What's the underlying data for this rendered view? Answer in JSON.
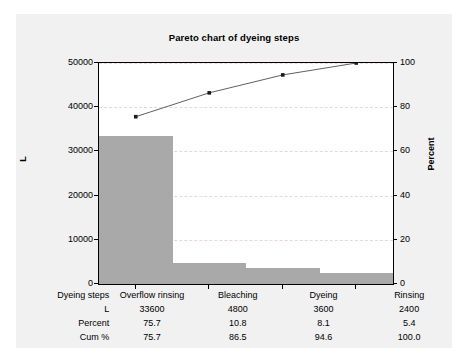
{
  "chart_data": {
    "type": "bar",
    "title": "Pareto chart of dyeing steps",
    "categories": [
      "Overflow rinsing",
      "Bleaching",
      "Dyeing",
      "Rinsing"
    ],
    "values": [
      33600,
      4800,
      3600,
      2400
    ],
    "percent": [
      75.7,
      10.8,
      8.1,
      5.4
    ],
    "cum_percent": [
      75.7,
      86.5,
      94.6,
      100.0
    ],
    "xlabel": "Dyeing steps",
    "ylabel": "L",
    "ylabel_right": "Percent",
    "ylim": [
      0,
      50000
    ],
    "ylim_right": [
      0,
      100
    ],
    "yticks": [
      "0",
      "10000",
      "20000",
      "30000",
      "40000",
      "50000"
    ],
    "ytick_values": [
      0,
      10000,
      20000,
      30000,
      40000,
      50000
    ],
    "yticks_right": [
      "0",
      "20",
      "40",
      "60",
      "80",
      "100"
    ],
    "ytick_values_right": [
      0,
      20,
      40,
      60,
      80,
      100
    ],
    "grid": true,
    "legend": "none",
    "series": [
      {
        "name": "L",
        "type": "bar",
        "values": [
          33600,
          4800,
          3600,
          2400
        ],
        "color": "#a9a9a9"
      },
      {
        "name": "Cum %",
        "type": "line",
        "values": [
          75.7,
          86.5,
          94.6,
          100.0
        ],
        "color": "#4d4d4d",
        "marker": "square"
      }
    ]
  },
  "table": {
    "rows": [
      {
        "label": "Dyeing steps",
        "cells": [
          "Overflow rinsing",
          "Bleaching",
          "Dyeing",
          "Rinsing"
        ]
      },
      {
        "label": "L",
        "cells": [
          "33600",
          "4800",
          "3600",
          "2400"
        ]
      },
      {
        "label": "Percent",
        "cells": [
          "75.7",
          "10.8",
          "8.1",
          "5.4"
        ]
      },
      {
        "label": "Cum %",
        "cells": [
          "75.7",
          "86.5",
          "94.6",
          "100.0"
        ]
      }
    ]
  },
  "colors": {
    "bar": "#a9a9a9",
    "line": "#4d4d4d",
    "grid": "#e8d9d9",
    "card_bg": "#f1f1f1",
    "plot_bg": "#ffffff",
    "axis": "#000000"
  }
}
